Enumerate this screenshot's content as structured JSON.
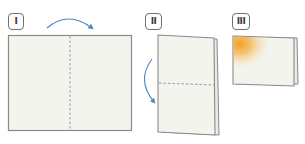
{
  "diagram": {
    "type": "folding-instructions",
    "steps": [
      {
        "label": "I",
        "description": "flat sheet with vertical dashed fold line, arrow folding left half over right"
      },
      {
        "label": "II",
        "description": "folded vertical card with horizontal dashed fold line, arrow folding top down"
      },
      {
        "label": "III",
        "description": "finished tent card with orange glow in top-left corner"
      }
    ],
    "colors": {
      "paper": "#f4f4ee",
      "paper_edge": "#8a8a8a",
      "fold_line": "#9a9a9a",
      "arrow": "#4a86c5",
      "accent_glow": "#f29a1a",
      "badge_border": "#6f6f6f"
    }
  }
}
